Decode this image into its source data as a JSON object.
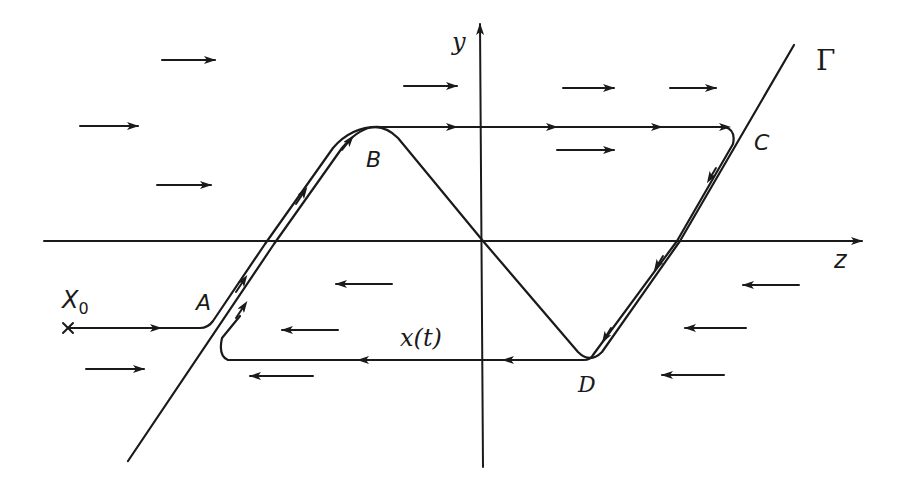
{
  "diagram": {
    "type": "phase-plane relaxation oscillation",
    "axes": {
      "horizontal": {
        "label": "z"
      },
      "vertical": {
        "label": "y"
      }
    },
    "curve_label": "Γ",
    "trajectory_label": "x(t)",
    "start_point": {
      "label": "X",
      "subscript": "0"
    },
    "points": {
      "A": "A",
      "B": "B",
      "C": "C",
      "D": "D"
    },
    "field_arrows": {
      "upper_region_direction": "right",
      "lower_region_direction": "left",
      "right_arrows": [
        {
          "x1": 162,
          "y1": 60,
          "x2": 215,
          "y2": 60
        },
        {
          "x1": 80,
          "y1": 126,
          "x2": 138,
          "y2": 126
        },
        {
          "x1": 157,
          "y1": 185,
          "x2": 211,
          "y2": 185
        },
        {
          "x1": 404,
          "y1": 86,
          "x2": 457,
          "y2": 86
        },
        {
          "x1": 563,
          "y1": 88,
          "x2": 614,
          "y2": 88
        },
        {
          "x1": 670,
          "y1": 88,
          "x2": 716,
          "y2": 88
        },
        {
          "x1": 557,
          "y1": 150,
          "x2": 614,
          "y2": 150
        },
        {
          "x1": 86,
          "y1": 369,
          "x2": 144,
          "y2": 369
        }
      ],
      "left_arrows": [
        {
          "x1": 392,
          "y1": 284,
          "x2": 336,
          "y2": 284
        },
        {
          "x1": 338,
          "y1": 330,
          "x2": 282,
          "y2": 330
        },
        {
          "x1": 313,
          "y1": 376,
          "x2": 250,
          "y2": 376
        },
        {
          "x1": 799,
          "y1": 285,
          "x2": 743,
          "y2": 285
        },
        {
          "x1": 746,
          "y1": 328,
          "x2": 685,
          "y2": 328
        },
        {
          "x1": 724,
          "y1": 375,
          "x2": 662,
          "y2": 375
        }
      ]
    }
  }
}
